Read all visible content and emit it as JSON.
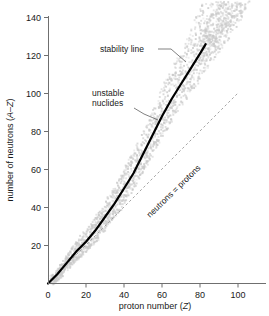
{
  "chart_data": {
    "type": "scatter",
    "title": "",
    "xlabel": "proton number (Z)",
    "ylabel": "number of neutrons (A–Z)",
    "xlabel_plain": "proton number (",
    "xlabel_italic": "Z",
    "xlabel_tail": ")",
    "ylabel_plain": "number of neutrons (",
    "ylabel_italic": "A–Z",
    "ylabel_tail": ")",
    "xlim": [
      0,
      115
    ],
    "ylim": [
      0,
      150
    ],
    "xticks": [
      0,
      20,
      40,
      60,
      80,
      100
    ],
    "yticks": [
      20,
      40,
      60,
      80,
      100,
      120,
      140
    ],
    "grid": false,
    "legend": "none",
    "series": [
      {
        "name": "stability line",
        "type": "line",
        "style": "solid-thick-black",
        "x": [
          0,
          5,
          10,
          15,
          20,
          25,
          30,
          35,
          40,
          45,
          50,
          55,
          60,
          65,
          70,
          75,
          80,
          83
        ],
        "y": [
          0,
          5,
          11,
          17,
          22,
          28,
          35,
          42,
          50,
          58,
          68,
          78,
          88,
          97,
          105,
          113,
          121,
          126
        ]
      },
      {
        "name": "neutrons = protons",
        "type": "line",
        "style": "dashed-gray",
        "x": [
          0,
          100
        ],
        "y": [
          0,
          100
        ]
      },
      {
        "name": "unstable nuclides",
        "type": "scatter",
        "style": "gray-speckle-band",
        "description": "pixelated gray band of unstable nuclides straddling the stability line, widening above it toward high Z"
      }
    ],
    "annotations": [
      {
        "name": "stability-line-label",
        "text": "stability line",
        "x_px": 100,
        "y_px": 49,
        "leader_to_x_px": 176,
        "leader_to_y_px": 62
      },
      {
        "name": "unstable-nuclides-label",
        "text_line1": "unstable",
        "text_line2": "nuclides",
        "x_px": 92,
        "y_px": 93,
        "leader_to_x_px": 155,
        "leader_to_y_px": 118
      },
      {
        "name": "neutrons-equals-protons-label",
        "text": "neutrons = protons",
        "rotation_deg": -44,
        "x_px": 146,
        "y_px": 215
      }
    ]
  },
  "colors": {
    "stability_line": "#000000",
    "equality_line": "#9a9a9a",
    "nuclide_band": "#c9c9c9",
    "axis": "#6f6f6f",
    "text": "#1a1a1a",
    "background": "#ffffff"
  },
  "axes": {
    "x_tick_labels": [
      "0",
      "20",
      "40",
      "60",
      "80",
      "100"
    ],
    "y_tick_labels": [
      "20",
      "40",
      "60",
      "80",
      "100",
      "120",
      "140"
    ]
  }
}
